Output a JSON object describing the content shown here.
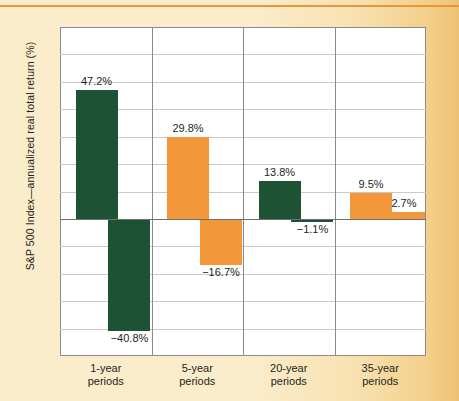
{
  "figure": {
    "background_color": "#fbeccb",
    "top_rule_color": "#e8963a"
  },
  "axis": {
    "y_title": "S&P 500 Index—annualized real total return (%)",
    "y_ticks": [
      "70",
      "60",
      "50",
      "40",
      "30",
      "20",
      "10",
      "0",
      "−10",
      "−20",
      "−30",
      "−40",
      "−50"
    ]
  },
  "colors": {
    "green": "#1d5334",
    "orange": "#f2983b",
    "grid": "#c9c9c9",
    "axis": "#8b8b8b",
    "zero_line": "#6f6f6f",
    "text": "#231f20"
  },
  "groups": [
    {
      "label_line1": "1-year",
      "label_line2": "periods"
    },
    {
      "label_line1": "5-year",
      "label_line2": "periods"
    },
    {
      "label_line1": "20-year",
      "label_line2": "periods"
    },
    {
      "label_line1": "35-year",
      "label_line2": "periods"
    }
  ],
  "bars": [
    {
      "group": 0,
      "kind": "best",
      "value": 47.2,
      "label": "47.2%",
      "color": "green"
    },
    {
      "group": 0,
      "kind": "worst",
      "value": -40.8,
      "label": "−40.8%",
      "color": "green"
    },
    {
      "group": 1,
      "kind": "best",
      "value": 29.8,
      "label": "29.8%",
      "color": "orange"
    },
    {
      "group": 1,
      "kind": "worst",
      "value": -16.7,
      "label": "−16.7%",
      "color": "orange"
    },
    {
      "group": 2,
      "kind": "best",
      "value": 13.8,
      "label": "13.8%",
      "color": "green"
    },
    {
      "group": 2,
      "kind": "worst",
      "value": -1.1,
      "label": "−1.1%",
      "color": "green"
    },
    {
      "group": 3,
      "kind": "best",
      "value": 9.5,
      "label": "9.5%",
      "color": "orange"
    },
    {
      "group": 3,
      "kind": "worst",
      "value": 2.7,
      "label": "2.7%",
      "color": "orange"
    }
  ],
  "chart_data": {
    "type": "bar",
    "title": "",
    "subtitle": "",
    "xlabel": "",
    "ylabel": "S&P 500 Index—annualized real total return (%)",
    "categories": [
      "1-year periods",
      "5-year periods",
      "20-year periods",
      "35-year periods"
    ],
    "series": [
      {
        "name": "Best period",
        "values": [
          47.2,
          29.8,
          13.8,
          9.5
        ]
      },
      {
        "name": "Worst period",
        "values": [
          -40.8,
          -16.7,
          -1.1,
          2.7
        ]
      }
    ],
    "data_labels": [
      [
        "47.2%",
        "29.8%",
        "13.8%",
        "9.5%"
      ],
      [
        "−40.8%",
        "−16.7%",
        "−1.1%",
        "2.7%"
      ]
    ],
    "bar_colors": [
      [
        "#1d5334",
        "#f2983b",
        "#1d5334",
        "#f2983b"
      ],
      [
        "#1d5334",
        "#f2983b",
        "#1d5334",
        "#f2983b"
      ]
    ],
    "ylim": [
      -50,
      70
    ],
    "ytick_values": [
      70,
      60,
      50,
      40,
      30,
      20,
      10,
      0,
      -10,
      -20,
      -30,
      -40,
      -50
    ],
    "ytick_labels": [
      "70",
      "60",
      "50",
      "40",
      "30",
      "20",
      "10",
      "0",
      "−10",
      "−20",
      "−30",
      "−40",
      "−50"
    ],
    "grid": true,
    "grid_axis": "y",
    "legend": false,
    "legend_position": "none",
    "group_separators": true,
    "zero_line": true
  }
}
